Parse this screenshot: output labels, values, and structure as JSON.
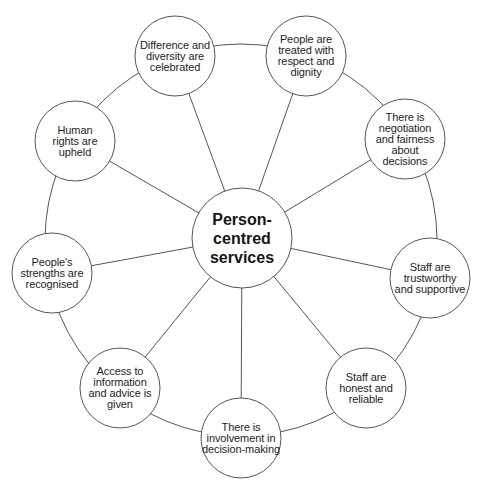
{
  "diagram": {
    "center": {
      "label": "Person-\ncentred\nservices",
      "cx": 242,
      "cy": 238,
      "r": 50
    },
    "ring": {
      "cx": 241,
      "cy": 240,
      "r": 196
    },
    "colors": {
      "line": "#555555",
      "text": "#1e1e1e",
      "fill": "#ffffff",
      "background": "#ffffff"
    },
    "nodes": [
      {
        "id": "difference",
        "label": "Difference and\ndiversity are\ncelebrated",
        "cx": 175,
        "cy": 56,
        "r": 40
      },
      {
        "id": "respect",
        "label": "People are\ntreated with\nrespect and\ndignity",
        "cx": 306,
        "cy": 56,
        "r": 40
      },
      {
        "id": "negotiation",
        "label": "There is\nnegotiation\nand fairness\nabout\ndecisions",
        "cx": 405,
        "cy": 139,
        "r": 40
      },
      {
        "id": "trustworthy",
        "label": "Staff are\ntrustworthy\nand supportive",
        "cx": 430,
        "cy": 278,
        "r": 40
      },
      {
        "id": "honest",
        "label": "Staff are\nhonest and\nreliable",
        "cx": 366,
        "cy": 388,
        "r": 40
      },
      {
        "id": "involvement",
        "label": "There is\ninvolvement in\ndecision-making",
        "cx": 241,
        "cy": 438,
        "r": 40
      },
      {
        "id": "access",
        "label": "Access to\ninformation\nand advice is\ngiven",
        "cx": 120,
        "cy": 388,
        "r": 40
      },
      {
        "id": "strengths",
        "label": "People's\nstrengths are\nrecognised",
        "cx": 52,
        "cy": 273,
        "r": 40
      },
      {
        "id": "human-rights",
        "label": "Human\nrights are\nupheld",
        "cx": 75,
        "cy": 141,
        "r": 40
      }
    ]
  }
}
